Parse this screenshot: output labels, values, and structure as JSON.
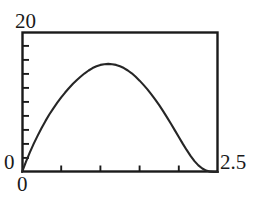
{
  "chart_data": {
    "type": "line",
    "title": "",
    "xlabel": "",
    "ylabel": "",
    "xlim": [
      0,
      2.5
    ],
    "ylim": [
      0,
      20
    ],
    "grid": false,
    "legend": null,
    "axis_labels": {
      "y_max": "20",
      "y_min": "0",
      "x_min": "0",
      "x_max": "2.5"
    },
    "ticks": {
      "x_major": [
        "0",
        "2.5"
      ],
      "x_interior_count": 4,
      "x_interior_values": [
        0.5,
        1.0,
        1.5,
        2.0
      ],
      "y_major": [
        "0",
        "20"
      ],
      "y_interior_count": 9,
      "y_interior_values": [
        2,
        4,
        6,
        8,
        10,
        12,
        14,
        16,
        18
      ]
    },
    "series": [
      {
        "name": "curve",
        "color": "#262626",
        "x": [
          0.0,
          0.05,
          0.1,
          0.15,
          0.2,
          0.25,
          0.3,
          0.35,
          0.4,
          0.45,
          0.5,
          0.55,
          0.6,
          0.65,
          0.7,
          0.75,
          0.8,
          0.85,
          0.9,
          0.95,
          1.0,
          1.05,
          1.1,
          1.15,
          1.2,
          1.25,
          1.3,
          1.35,
          1.4,
          1.45,
          1.5,
          1.55,
          1.6,
          1.65,
          1.7,
          1.75,
          1.8,
          1.85,
          1.9,
          1.95,
          2.0,
          2.05,
          2.1,
          2.15,
          2.2,
          2.25,
          2.3,
          2.35,
          2.4,
          2.45,
          2.5
        ],
        "y": [
          0.0,
          1.45,
          2.8,
          4.05,
          5.2,
          6.3,
          7.3,
          8.25,
          9.1,
          9.9,
          10.65,
          11.35,
          12.0,
          12.6,
          13.15,
          13.65,
          14.1,
          14.5,
          14.85,
          15.1,
          15.3,
          15.4,
          15.45,
          15.4,
          15.3,
          15.1,
          14.85,
          14.5,
          14.1,
          13.6,
          13.05,
          12.45,
          11.8,
          11.1,
          10.35,
          9.55,
          8.7,
          7.8,
          6.9,
          5.95,
          5.0,
          4.05,
          3.15,
          2.3,
          1.55,
          0.95,
          0.5,
          0.2,
          0.05,
          0.0,
          0.0
        ],
        "peak": {
          "x": 1.1,
          "y": 15.45
        }
      }
    ]
  },
  "frame": {
    "color": "#1a1a1a",
    "left": 22,
    "top": 32,
    "right": 218,
    "bottom": 172
  }
}
